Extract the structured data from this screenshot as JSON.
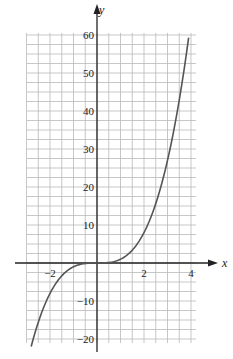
{
  "chart_data": {
    "type": "line",
    "title": "",
    "xlabel": "x",
    "ylabel": "y",
    "xlim": [
      -3,
      4.2
    ],
    "ylim": [
      -20,
      60
    ],
    "grid": true,
    "x_ticks": [
      {
        "value": -2,
        "label": "-2"
      },
      {
        "value": 2,
        "label": "2"
      },
      {
        "value": 4,
        "label": "4"
      }
    ],
    "y_ticks": [
      {
        "value": 60,
        "label": "60"
      },
      {
        "value": 50,
        "label": "50"
      },
      {
        "value": 40,
        "label": "40"
      },
      {
        "value": 30,
        "label": "30"
      },
      {
        "value": 20,
        "label": "20"
      },
      {
        "value": 10,
        "label": "10"
      },
      {
        "value": -10,
        "label": "-10"
      },
      {
        "value": -20,
        "label": "-20"
      }
    ],
    "series": [
      {
        "name": "y = x^3",
        "x": [
          -2.8,
          -2.5,
          -2,
          -1.5,
          -1,
          -0.5,
          0,
          0.5,
          1,
          1.5,
          2,
          2.5,
          3,
          3.5,
          3.9
        ],
        "values": [
          -21.95,
          -15.63,
          -8,
          -3.38,
          -1,
          -0.13,
          0,
          0.13,
          1,
          3.38,
          8,
          15.63,
          27,
          42.88,
          59.32
        ]
      }
    ],
    "colors": {
      "grid": "#b9b9b9",
      "axis": "#222222",
      "curve": "#555555"
    }
  }
}
